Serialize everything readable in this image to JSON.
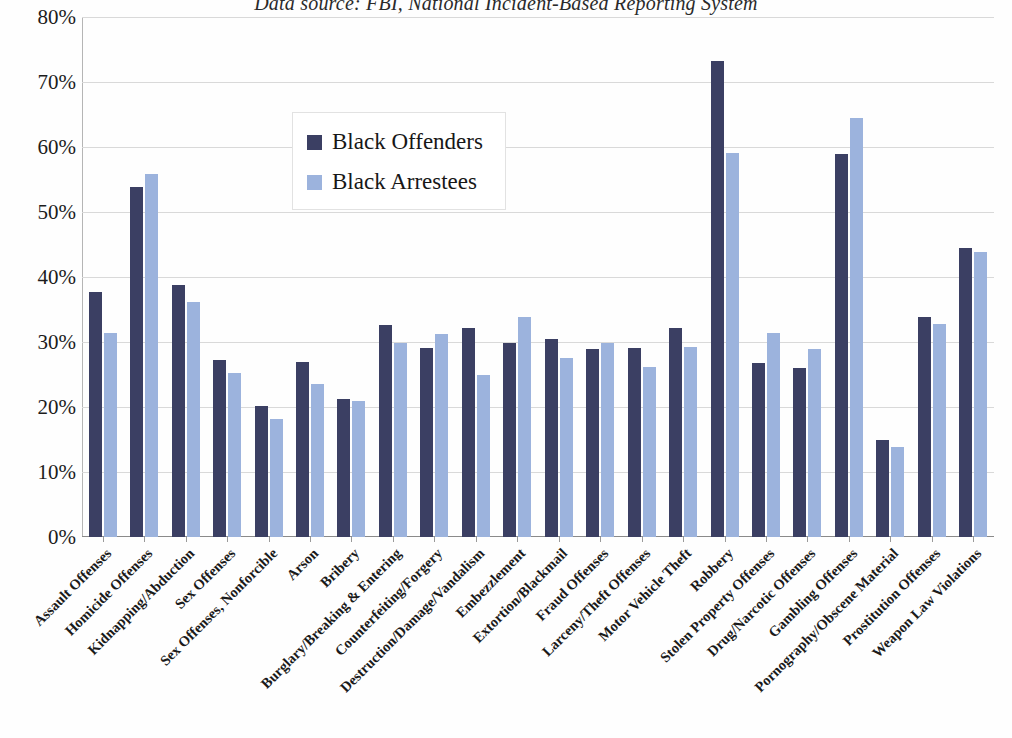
{
  "chart_data": {
    "type": "bar",
    "title": "Data source: FBI, National Incident-Based Reporting System",
    "xlabel": "",
    "ylabel": "",
    "ylim": [
      0,
      80
    ],
    "ytick_labels": [
      "80%",
      "70%",
      "60%",
      "50%",
      "40%",
      "30%",
      "20%",
      "10%",
      "0%"
    ],
    "ytick_values": [
      80,
      70,
      60,
      50,
      40,
      30,
      20,
      10,
      0
    ],
    "grid": true,
    "legend_position": "upper-left-inside",
    "colors": {
      "offenders": "#3b3f63",
      "arrestees": "#9cb3dd",
      "gridline": "#d9d9d9",
      "axis": "#8a8a8a",
      "text": "#1a1a1a"
    },
    "categories": [
      "Assault Offenses",
      "Homicide Offenses",
      "Kidnapping/Abduction",
      "Sex Offenses",
      "Sex Offenses, Nonforcible",
      "Arson",
      "Bribery",
      "Burglary/Breaking & Entering",
      "Counterfeiting/Forgery",
      "Destruction/Damage/Vandalism",
      "Embezzlement",
      "Extortion/Blackmail",
      "Fraud Offenses",
      "Larceny/Theft Offenses",
      "Motor Vehicle Theft",
      "Robbery",
      "Stolen Property Offenses",
      "Drug/Narcotic Offenses",
      "Gambling Offenses",
      "Pornography/Obscene Material",
      "Prostitution Offenses",
      "Weapon Law Violations"
    ],
    "series": [
      {
        "name": "Black Offenders",
        "color": "#3b3f63",
        "values": [
          37.7,
          53.8,
          38.7,
          27.3,
          20.1,
          27.0,
          21.3,
          32.6,
          29.1,
          32.1,
          29.8,
          30.4,
          28.9,
          29.1,
          32.1,
          73.2,
          26.8,
          26.0,
          59.0,
          15.0,
          33.8,
          44.5
        ]
      },
      {
        "name": "Black Arrestees",
        "color": "#9cb3dd",
        "values": [
          31.4,
          55.8,
          36.1,
          25.2,
          18.1,
          23.5,
          20.9,
          29.8,
          31.2,
          25.0,
          33.8,
          27.6,
          29.9,
          26.2,
          29.2,
          59.1,
          31.4,
          29.0,
          64.5,
          13.9,
          32.7,
          43.9
        ]
      }
    ]
  }
}
